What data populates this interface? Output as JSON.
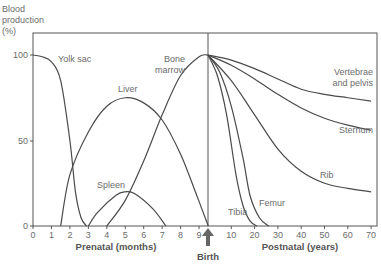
{
  "chart_data": {
    "type": "line",
    "title": "",
    "ylabel": "Blood production (%)",
    "ylabel_lines": [
      "Blood",
      "production",
      "(%)"
    ],
    "xlabel_prenatal": "Prenatal (months)",
    "xlabel_postnatal": "Postnatal (years)",
    "birth_label": "Birth",
    "ylim": [
      0,
      100
    ],
    "yticks": [
      "0",
      "50",
      "100"
    ],
    "xticks_prenatal": [
      "0",
      "1",
      "2",
      "3",
      "4",
      "5",
      "6",
      "7",
      "8",
      "9"
    ],
    "xticks_postnatal": [
      "10",
      "20",
      "30",
      "40",
      "50",
      "60",
      "70"
    ],
    "grid": false,
    "series": [
      {
        "name": "Yolk sac",
        "label": "Yolk sac",
        "phase": "prenatal",
        "points": [
          [
            0,
            100
          ],
          [
            0.5,
            99
          ],
          [
            1,
            96
          ],
          [
            1.5,
            85
          ],
          [
            2,
            50
          ],
          [
            2.3,
            20
          ],
          [
            2.6,
            5
          ],
          [
            2.9,
            0
          ]
        ]
      },
      {
        "name": "Liver",
        "label": "Liver",
        "phase": "prenatal",
        "points": [
          [
            1.5,
            0
          ],
          [
            2,
            30
          ],
          [
            3,
            55
          ],
          [
            4,
            70
          ],
          [
            5,
            75
          ],
          [
            6,
            72
          ],
          [
            7,
            62
          ],
          [
            8,
            42
          ],
          [
            8.8,
            20
          ],
          [
            9.5,
            0
          ]
        ]
      },
      {
        "name": "Spleen",
        "label": "Spleen",
        "phase": "prenatal",
        "points": [
          [
            3,
            0
          ],
          [
            3.5,
            8
          ],
          [
            4.5,
            18
          ],
          [
            5,
            20
          ],
          [
            5.5,
            19
          ],
          [
            6.5,
            10
          ],
          [
            7.2,
            0
          ]
        ]
      },
      {
        "name": "Bone marrow",
        "label_lines": [
          "Bone",
          "marrow"
        ],
        "phase": "prenatal",
        "points": [
          [
            4,
            0
          ],
          [
            5,
            15
          ],
          [
            6,
            38
          ],
          [
            7,
            65
          ],
          [
            8,
            88
          ],
          [
            9,
            99
          ],
          [
            9.5,
            100
          ]
        ]
      },
      {
        "name": "Vertebrae and pelvis",
        "label_lines": [
          "Vertebrae",
          "and pelvis"
        ],
        "phase": "postnatal",
        "points": [
          [
            0,
            100
          ],
          [
            10,
            97
          ],
          [
            20,
            92
          ],
          [
            30,
            86
          ],
          [
            40,
            80
          ],
          [
            50,
            77
          ],
          [
            60,
            75
          ],
          [
            70,
            73
          ]
        ]
      },
      {
        "name": "Sternum",
        "label": "Sternum",
        "phase": "postnatal",
        "points": [
          [
            0,
            100
          ],
          [
            10,
            94
          ],
          [
            20,
            86
          ],
          [
            30,
            77
          ],
          [
            40,
            69
          ],
          [
            50,
            63
          ],
          [
            60,
            59
          ],
          [
            70,
            56
          ]
        ]
      },
      {
        "name": "Rib",
        "label": "Rib",
        "phase": "postnatal",
        "points": [
          [
            0,
            100
          ],
          [
            10,
            85
          ],
          [
            20,
            65
          ],
          [
            30,
            45
          ],
          [
            40,
            32
          ],
          [
            50,
            25
          ],
          [
            60,
            22
          ],
          [
            70,
            20
          ]
        ]
      },
      {
        "name": "Femur",
        "label": "Femur",
        "phase": "postnatal",
        "points": [
          [
            0,
            100
          ],
          [
            5,
            90
          ],
          [
            10,
            70
          ],
          [
            15,
            40
          ],
          [
            18,
            18
          ],
          [
            22,
            5
          ],
          [
            26,
            0
          ]
        ]
      },
      {
        "name": "Tibia",
        "label": "Tibia",
        "phase": "postnatal",
        "points": [
          [
            0,
            100
          ],
          [
            4,
            88
          ],
          [
            8,
            65
          ],
          [
            12,
            30
          ],
          [
            15,
            12
          ],
          [
            18,
            3
          ],
          [
            21,
            0
          ]
        ]
      }
    ]
  }
}
